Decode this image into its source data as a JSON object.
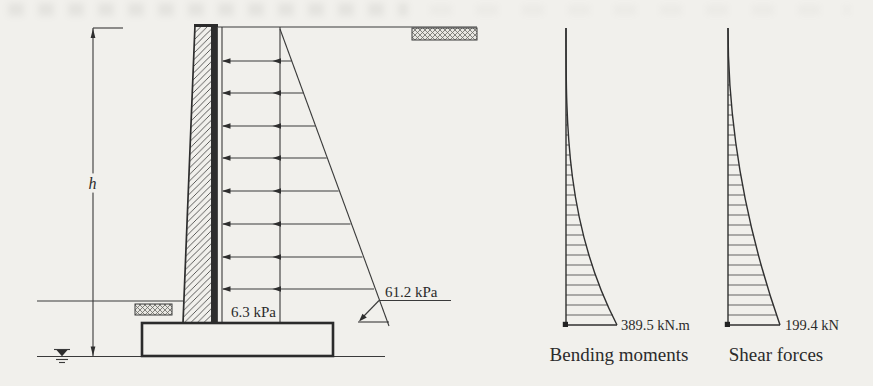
{
  "colors": {
    "paper": "#f1f0ec",
    "ink": "#3a3a3a"
  },
  "retaining_wall": {
    "height_label": "h",
    "uniform_pressure_label": "6.3 kPa",
    "base_pressure_label": "61.2 kPa"
  },
  "bending_moments": {
    "max_label": "389.5 kN.m",
    "caption": "Bending moments"
  },
  "shear_forces": {
    "max_label": "199.4 kN",
    "caption": "Shear forces"
  }
}
